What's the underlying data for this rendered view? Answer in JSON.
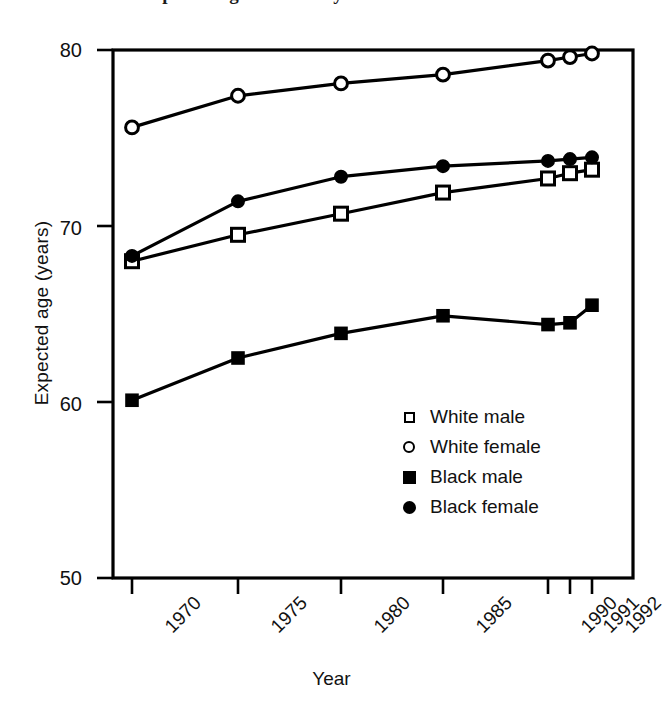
{
  "figure": {
    "title_fragment": "Expected age of death by race and sex",
    "background_color": "#ffffff",
    "ink_color": "#000000"
  },
  "axes": {
    "xlabel": "Year",
    "ylabel": "Expected age (years)",
    "yticks": [
      "50",
      "60",
      "70",
      "80"
    ],
    "xticks": [
      "1970",
      "1975",
      "1980",
      "1985",
      "1990",
      "1991",
      "1992"
    ]
  },
  "legend": {
    "position": "inside-lower-right",
    "items": [
      {
        "label": "White male",
        "marker": "open-square",
        "marker_name": "open-square-marker"
      },
      {
        "label": "White female",
        "marker": "open-circle",
        "marker_name": "open-circle-marker"
      },
      {
        "label": "Black male",
        "marker": "filled-square",
        "marker_name": "filled-square-marker"
      },
      {
        "label": "Black female",
        "marker": "filled-circle",
        "marker_name": "filled-circle-marker"
      }
    ]
  },
  "chart_data": {
    "type": "line",
    "title": "Expected age of death by race and sex",
    "xlabel": "Year",
    "ylabel": "Expected age (years)",
    "categories": [
      "1970",
      "1975",
      "1980",
      "1985",
      "1990",
      "1991",
      "1992"
    ],
    "x": [
      1970,
      1975,
      1980,
      1985,
      1990,
      1991,
      1992
    ],
    "xlim": [
      1968.5,
      1993.0
    ],
    "ylim": [
      50,
      80
    ],
    "yticks": [
      50,
      60,
      70,
      80
    ],
    "grid": false,
    "legend_position": "inside-lower-right",
    "series": [
      {
        "name": "White male",
        "marker": "open-square",
        "color": "#000000",
        "values": [
          68.0,
          69.5,
          70.7,
          71.9,
          72.7,
          73.0,
          73.2
        ]
      },
      {
        "name": "White female",
        "marker": "open-circle",
        "color": "#000000",
        "values": [
          75.6,
          77.4,
          78.1,
          78.6,
          79.4,
          79.6,
          79.8
        ]
      },
      {
        "name": "Black male",
        "marker": "filled-square",
        "color": "#000000",
        "values": [
          60.1,
          62.5,
          63.9,
          64.9,
          64.4,
          64.5,
          65.5
        ]
      },
      {
        "name": "Black female",
        "marker": "filled-circle",
        "color": "#000000",
        "values": [
          68.3,
          71.4,
          72.8,
          73.4,
          73.7,
          73.8,
          73.9
        ]
      }
    ]
  }
}
